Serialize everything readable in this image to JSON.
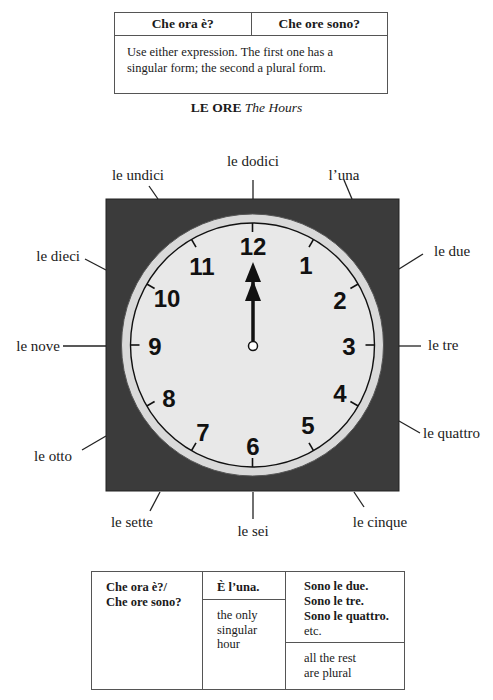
{
  "top_table": {
    "headers": [
      "Che ora è?",
      "Che ore sono?"
    ],
    "note": "Use either expression. The first one has a singular form; the second a plural form."
  },
  "title": {
    "bold": "LE ORE",
    "italic": "The Hours"
  },
  "clock": {
    "time_shown": "12:00",
    "numerals": [
      "12",
      "1",
      "2",
      "3",
      "4",
      "5",
      "6",
      "7",
      "8",
      "9",
      "10",
      "11"
    ],
    "hour_labels": {
      "12": "le dodici",
      "1": "l’una",
      "2": "le due",
      "3": "le tre",
      "4": "le quattro",
      "5": "le cinque",
      "6": "le sei",
      "7": "le sette",
      "8": "le otto",
      "9": "le nove",
      "10": "le dieci",
      "11": "le undici"
    },
    "colors": {
      "frame": "#3b3b3b",
      "rim": "#d9d9d9",
      "face": "#e8e8e8",
      "ink": "#111111"
    }
  },
  "bottom_table": {
    "col1": [
      "Che ora è?/",
      "Che ore sono?"
    ],
    "col2": {
      "answer": "È l’una.",
      "note": [
        "the only",
        "singular",
        "hour"
      ]
    },
    "col3": {
      "answers": [
        "Sono le due.",
        "Sono le tre.",
        "Sono le quattro."
      ],
      "etc": "etc.",
      "note": [
        "all the rest",
        "are plural"
      ]
    }
  }
}
